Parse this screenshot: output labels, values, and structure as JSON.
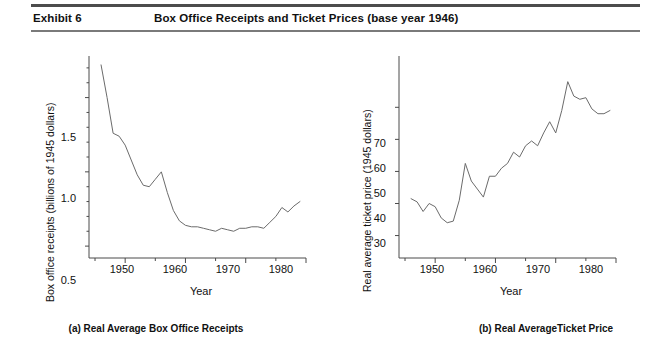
{
  "header": {
    "exhibit_label": "Exhibit 6",
    "title": "Box Office Receipts and Ticket Prices (base year 1946)"
  },
  "panels": [
    {
      "id": "panel-a",
      "caption": "(a) Real Average Box Office Receipts",
      "ylabel": "Box office receipts (billions of 1945 dollars)",
      "xlabel": "Year",
      "ytick_labels": [
        "1.5",
        "1.0",
        "0.5"
      ],
      "xtick_labels": [
        "1950",
        "1960",
        "1970",
        "1980"
      ]
    },
    {
      "id": "panel-b",
      "caption": "(b) Real AverageTicket Price",
      "ylabel": "Real average ticket price (1945 dollars)",
      "xlabel": "Year",
      "ytick_labels": [
        "70",
        "60",
        "50",
        "40",
        "30"
      ],
      "xtick_labels": [
        "1950",
        "1960",
        "1970",
        "1980"
      ]
    }
  ],
  "chart_data": [
    {
      "type": "line",
      "id": "real-average-box-office-receipts",
      "title": "(a) Real Average Box Office Receipts",
      "xlabel": "Year",
      "ylabel": "Box office receipts (billions of 1945 dollars)",
      "xlim": [
        1944,
        1980
      ],
      "ylim": [
        0.42,
        1.78
      ],
      "xticks": [
        1950,
        1960,
        1970,
        1980
      ],
      "xminor_ticks": [
        1945,
        1955,
        1965,
        1975
      ],
      "yticks": [
        0.5,
        1.0,
        1.5
      ],
      "yminor_ticks": [
        0.6,
        0.7,
        0.8,
        0.9,
        1.1,
        1.2,
        1.3,
        1.4,
        1.6,
        1.7
      ],
      "grid": false,
      "legend": "none",
      "x": [
        1946,
        1947,
        1948,
        1949,
        1950,
        1951,
        1952,
        1953,
        1954,
        1955,
        1956,
        1957,
        1958,
        1959,
        1960,
        1961,
        1962,
        1963,
        1964,
        1965,
        1966,
        1967,
        1968,
        1969,
        1970,
        1971,
        1972,
        1973,
        1974,
        1975,
        1976,
        1977,
        1978,
        1979
      ],
      "values": [
        1.72,
        1.5,
        1.26,
        1.24,
        1.18,
        1.08,
        0.98,
        0.91,
        0.9,
        0.95,
        1.0,
        0.86,
        0.74,
        0.67,
        0.64,
        0.63,
        0.63,
        0.62,
        0.61,
        0.6,
        0.62,
        0.61,
        0.6,
        0.62,
        0.62,
        0.63,
        0.63,
        0.62,
        0.66,
        0.7,
        0.76,
        0.73,
        0.77,
        0.8
      ]
    },
    {
      "type": "line",
      "id": "real-average-ticket-price",
      "title": "(b) Real AverageTicket Price",
      "xlabel": "Year",
      "ylabel": "Real average ticket price (1945 dollars)",
      "xlim": [
        1944,
        1980
      ],
      "ylim": [
        23,
        86
      ],
      "xticks": [
        1950,
        1960,
        1970,
        1980
      ],
      "xminor_ticks": [
        1945,
        1955,
        1965,
        1975
      ],
      "yticks": [
        30,
        40,
        50,
        60,
        70
      ],
      "grid": false,
      "legend": "none",
      "x": [
        1946,
        1947,
        1948,
        1949,
        1950,
        1951,
        1952,
        1953,
        1954,
        1955,
        1956,
        1957,
        1958,
        1959,
        1960,
        1961,
        1962,
        1963,
        1964,
        1965,
        1966,
        1967,
        1968,
        1969,
        1970,
        1971,
        1972,
        1973,
        1974,
        1975,
        1976,
        1977,
        1978,
        1979
      ],
      "values": [
        41.5,
        40.5,
        37.5,
        40.0,
        39.0,
        35.5,
        34.0,
        34.5,
        41.0,
        52.5,
        47.0,
        44.5,
        42.0,
        48.5,
        48.5,
        51.0,
        52.5,
        56.0,
        54.5,
        58.0,
        59.5,
        58.0,
        62.0,
        65.5,
        62.0,
        69.0,
        78.0,
        73.5,
        72.5,
        73.0,
        69.5,
        68.0,
        68.0,
        69.0
      ]
    }
  ],
  "colors": {
    "line": "#6b6b6b",
    "axis": "#4a4a4a",
    "rule_top": "#4c4c4c",
    "rule_bottom": "#7a7a7a",
    "text": "#111111"
  }
}
